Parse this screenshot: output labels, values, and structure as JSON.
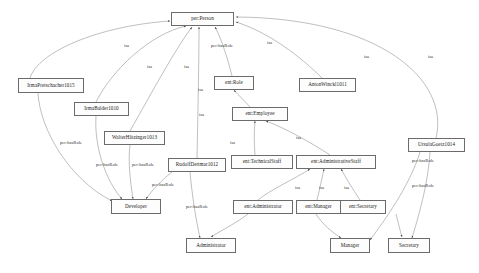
{
  "diagram": {
    "background_color": "#ffffff",
    "node_border_color": "#6b6b6b",
    "edge_color": "#8a8a8a",
    "nodes": [
      {
        "id": "per_person",
        "label": "per:Person",
        "x": 171,
        "y": 12,
        "w": 63,
        "h": 14
      },
      {
        "id": "ent_role",
        "label": "ent:Role",
        "x": 214,
        "y": 76,
        "w": 40,
        "h": 14
      },
      {
        "id": "ent_employee",
        "label": "ent:Employee",
        "x": 232,
        "y": 107,
        "w": 56,
        "h": 14
      },
      {
        "id": "ent_technical",
        "label": "ent:TechnicalStaff",
        "x": 231,
        "y": 155,
        "w": 62,
        "h": 14
      },
      {
        "id": "ent_admin_staff",
        "label": "ent:AdministrativeStaff",
        "x": 296,
        "y": 155,
        "w": 80,
        "h": 14
      },
      {
        "id": "ent_administrator",
        "label": "ent:Administrator",
        "x": 233,
        "y": 200,
        "w": 60,
        "h": 14
      },
      {
        "id": "ent_manager",
        "label": "ent:Manager",
        "x": 296,
        "y": 200,
        "w": 45,
        "h": 14
      },
      {
        "id": "ent_secretary",
        "label": "ent:Secretary",
        "x": 340,
        "y": 200,
        "w": 46,
        "h": 14
      },
      {
        "id": "developer",
        "label": "Developer",
        "x": 111,
        "y": 199,
        "w": 50,
        "h": 15
      },
      {
        "id": "administrator",
        "label": "Administrator",
        "x": 186,
        "y": 238,
        "w": 50,
        "h": 15
      },
      {
        "id": "manager",
        "label": "Manager",
        "x": 330,
        "y": 238,
        "w": 40,
        "h": 15
      },
      {
        "id": "secretary",
        "label": "Secretary",
        "x": 388,
        "y": 238,
        "w": 42,
        "h": 15
      },
      {
        "id": "irma_prein",
        "label": "IrmaPretschacher1015",
        "x": 18,
        "y": 78,
        "w": 66,
        "h": 15
      },
      {
        "id": "irma_balder",
        "label": "IrmaBalder1010",
        "x": 74,
        "y": 102,
        "w": 55,
        "h": 14
      },
      {
        "id": "walter_hatz",
        "label": "WalterHätzinger1013",
        "x": 104,
        "y": 131,
        "w": 61,
        "h": 14
      },
      {
        "id": "rudolf_dettmar",
        "label": "RudolfDettmar1012",
        "x": 168,
        "y": 158,
        "w": 58,
        "h": 14
      },
      {
        "id": "anton_winckl",
        "label": "AntonWinckl1011",
        "x": 299,
        "y": 78,
        "w": 57,
        "h": 14
      },
      {
        "id": "ursula_goetz",
        "label": "UrsulaGoetz1014",
        "x": 408,
        "y": 138,
        "w": 57,
        "h": 14
      }
    ],
    "edge_labels": [
      {
        "id": "lbl_hasrole_top",
        "text": "per:hasRole",
        "x": 211,
        "y": 44
      },
      {
        "id": "lbl_isa_role",
        "text": "isa",
        "x": 267,
        "y": 41
      },
      {
        "id": "lbl_isa_employee",
        "text": "isa",
        "x": 199,
        "y": 113
      },
      {
        "id": "lbl_isa_tech",
        "text": "isa",
        "x": 230,
        "y": 141
      },
      {
        "id": "lbl_isa_adminstaff",
        "text": "isa",
        "x": 296,
        "y": 136
      },
      {
        "id": "lbl_isa_adm",
        "text": "isa",
        "x": 295,
        "y": 186
      },
      {
        "id": "lbl_isa_mgr",
        "text": "isa",
        "x": 319,
        "y": 186
      },
      {
        "id": "lbl_isa_sec",
        "text": "isa",
        "x": 344,
        "y": 186
      },
      {
        "id": "lbl_hr_left1",
        "text": "per:hasRole",
        "x": 60,
        "y": 141
      },
      {
        "id": "lbl_hr_left2",
        "text": "per:hasRole",
        "x": 96,
        "y": 163
      },
      {
        "id": "lbl_hr_left3",
        "text": "per:hasRole",
        "x": 132,
        "y": 163
      },
      {
        "id": "lbl_hr_left4",
        "text": "per:hasRole",
        "x": 152,
        "y": 183
      },
      {
        "id": "lbl_hr_mid",
        "text": "per:hasRole",
        "x": 186,
        "y": 205
      },
      {
        "id": "lbl_hr_right",
        "text": "per:hasRole",
        "x": 412,
        "y": 159
      },
      {
        "id": "lbl_hr_right2",
        "text": "per:hasRole",
        "x": 412,
        "y": 184
      },
      {
        "id": "lbl_n1",
        "text": "isa",
        "x": 124,
        "y": 44
      },
      {
        "id": "lbl_n2",
        "text": "isa",
        "x": 147,
        "y": 65
      },
      {
        "id": "lbl_n3",
        "text": "isa",
        "x": 184,
        "y": 65
      },
      {
        "id": "lbl_n4",
        "text": "isa",
        "x": 198,
        "y": 88
      },
      {
        "id": "lbl_n5",
        "text": "isa",
        "x": 364,
        "y": 55
      },
      {
        "id": "lbl_n6",
        "text": "isa",
        "x": 428,
        "y": 55
      }
    ],
    "edges": [
      {
        "id": "e_person_role",
        "from": "ent_role",
        "to": "per_person"
      },
      {
        "id": "e_role_employee",
        "from": "ent_employee",
        "to": "ent_role"
      },
      {
        "id": "e_emp_tech",
        "from": "ent_technical",
        "to": "ent_employee"
      },
      {
        "id": "e_emp_adminstaff",
        "from": "ent_admin_staff",
        "to": "ent_employee"
      },
      {
        "id": "e_as_administrator",
        "from": "ent_administrator",
        "to": "ent_admin_staff"
      },
      {
        "id": "e_as_manager",
        "from": "ent_manager",
        "to": "ent_admin_staff"
      },
      {
        "id": "e_as_secretary",
        "from": "ent_secretary",
        "to": "ent_admin_staff"
      },
      {
        "id": "e_irma_person",
        "from": "irma_prein",
        "to": "per_person"
      },
      {
        "id": "e_balder_person",
        "from": "irma_balder",
        "to": "per_person"
      },
      {
        "id": "e_walter_person",
        "from": "walter_hatz",
        "to": "per_person"
      },
      {
        "id": "e_rudolf_person",
        "from": "rudolf_dettmar",
        "to": "per_person"
      },
      {
        "id": "e_anton_person",
        "from": "anton_winckl",
        "to": "per_person"
      },
      {
        "id": "e_ursula_person",
        "from": "ursula_goetz",
        "to": "per_person"
      },
      {
        "id": "e_irma_developer",
        "from": "irma_prein",
        "to": "developer"
      },
      {
        "id": "e_balder_developer",
        "from": "irma_balder",
        "to": "developer"
      },
      {
        "id": "e_walter_developer",
        "from": "walter_hatz",
        "to": "developer"
      },
      {
        "id": "e_rudolf_developer",
        "from": "rudolf_dettmar",
        "to": "developer"
      },
      {
        "id": "e_rudolf_admin",
        "from": "rudolf_dettmar",
        "to": "administrator"
      },
      {
        "id": "e_ursula_manager",
        "from": "ursula_goetz",
        "to": "manager"
      },
      {
        "id": "e_ursula_secretary",
        "from": "ursula_goetz",
        "to": "secretary"
      },
      {
        "id": "e_manager_inst",
        "from": "ent_manager",
        "to": "manager"
      },
      {
        "id": "e_secretary_inst",
        "from": "ent_secretary",
        "to": "secretary"
      },
      {
        "id": "e_administrator_inst",
        "from": "ent_administrator",
        "to": "administrator"
      }
    ]
  }
}
